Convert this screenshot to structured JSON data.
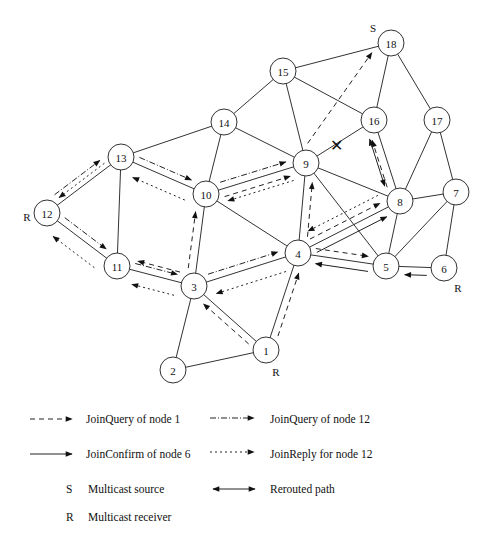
{
  "diagram": {
    "nodes": [
      {
        "id": "1",
        "x": 266,
        "y": 350,
        "role": "R",
        "role_dx": 10,
        "role_dy": 22
      },
      {
        "id": "2",
        "x": 173,
        "y": 370
      },
      {
        "id": "3",
        "x": 194,
        "y": 286
      },
      {
        "id": "4",
        "x": 298,
        "y": 253
      },
      {
        "id": "5",
        "x": 386,
        "y": 266
      },
      {
        "id": "6",
        "x": 444,
        "y": 268,
        "role": "R",
        "role_dx": 14,
        "role_dy": 20
      },
      {
        "id": "7",
        "x": 456,
        "y": 192
      },
      {
        "id": "8",
        "x": 400,
        "y": 201
      },
      {
        "id": "9",
        "x": 306,
        "y": 163
      },
      {
        "id": "10",
        "x": 206,
        "y": 194
      },
      {
        "id": "11",
        "x": 117,
        "y": 266
      },
      {
        "id": "12",
        "x": 47,
        "y": 213,
        "role": "R",
        "role_dx": -20,
        "role_dy": 4
      },
      {
        "id": "13",
        "x": 121,
        "y": 157
      },
      {
        "id": "14",
        "x": 224,
        "y": 122
      },
      {
        "id": "15",
        "x": 283,
        "y": 71
      },
      {
        "id": "16",
        "x": 374,
        "y": 120
      },
      {
        "id": "17",
        "x": 437,
        "y": 120
      },
      {
        "id": "18",
        "x": 391,
        "y": 43,
        "role": "S",
        "role_dx": -18,
        "role_dy": -15
      }
    ],
    "edges": [
      [
        "1",
        "2"
      ],
      [
        "1",
        "3"
      ],
      [
        "1",
        "4"
      ],
      [
        "2",
        "3"
      ],
      [
        "3",
        "4"
      ],
      [
        "3",
        "10"
      ],
      [
        "3",
        "11"
      ],
      [
        "4",
        "5"
      ],
      [
        "4",
        "8"
      ],
      [
        "4",
        "9"
      ],
      [
        "4",
        "10"
      ],
      [
        "5",
        "6"
      ],
      [
        "5",
        "7"
      ],
      [
        "5",
        "8"
      ],
      [
        "5",
        "9"
      ],
      [
        "6",
        "7"
      ],
      [
        "7",
        "8"
      ],
      [
        "7",
        "17"
      ],
      [
        "8",
        "9"
      ],
      [
        "8",
        "16"
      ],
      [
        "8",
        "17"
      ],
      [
        "9",
        "10"
      ],
      [
        "9",
        "14"
      ],
      [
        "9",
        "15"
      ],
      [
        "9",
        "16"
      ],
      [
        "10",
        "13"
      ],
      [
        "10",
        "14"
      ],
      [
        "11",
        "12"
      ],
      [
        "11",
        "13"
      ],
      [
        "12",
        "13"
      ],
      [
        "13",
        "14"
      ],
      [
        "14",
        "15"
      ],
      [
        "15",
        "16"
      ],
      [
        "15",
        "18"
      ],
      [
        "16",
        "18"
      ],
      [
        "17",
        "18"
      ]
    ],
    "broken_link": {
      "between": [
        "9",
        "16"
      ],
      "x": 336,
      "y": 145,
      "glyph": "✕"
    },
    "messages": [
      {
        "type": "joinquery1",
        "from": "1",
        "to": "3",
        "offset": -7
      },
      {
        "type": "joinquery1",
        "from": "1",
        "to": "4",
        "offset": 7
      },
      {
        "type": "joinquery1",
        "from": "3",
        "to": "11",
        "offset": 10
      },
      {
        "type": "joinquery1",
        "from": "3",
        "to": "10",
        "offset": -8
      },
      {
        "type": "joinquery1",
        "from": "4",
        "to": "9",
        "offset": 8
      },
      {
        "type": "joinquery1",
        "from": "4",
        "to": "5",
        "offset": -7
      },
      {
        "type": "joinquery1",
        "from": "4",
        "to": "8",
        "offset": -7
      },
      {
        "type": "joinquery1",
        "from": "10",
        "to": "9",
        "offset": 8
      },
      {
        "type": "joinquery1",
        "from": "9",
        "to": "18",
        "offset": -10,
        "via_broken": true
      },
      {
        "type": "joinquery1",
        "from": "8",
        "to": "16",
        "offset": -8
      },
      {
        "type": "joinconfirm6",
        "from": "6",
        "to": "5",
        "offset": -8
      },
      {
        "type": "joinconfirm6",
        "from": "5",
        "to": "4",
        "offset": -8
      },
      {
        "type": "joinconfirm6",
        "from": "4",
        "to": "8",
        "offset": 8
      },
      {
        "type": "joinquery12",
        "from": "12",
        "to": "13",
        "offset": -10
      },
      {
        "type": "joinquery12",
        "from": "13",
        "to": "10",
        "offset": -7
      },
      {
        "type": "joinquery12",
        "from": "12",
        "to": "11",
        "offset": -7
      },
      {
        "type": "joinquery12",
        "from": "11",
        "to": "3",
        "offset": -7
      },
      {
        "type": "joinquery12",
        "from": "3",
        "to": "4",
        "offset": -7
      },
      {
        "type": "joinquery12",
        "from": "10",
        "to": "9",
        "offset": -7
      },
      {
        "type": "joinreply12",
        "from": "9",
        "to": "10",
        "offset": -13
      },
      {
        "type": "joinreply12",
        "from": "10",
        "to": "13",
        "offset": -14
      },
      {
        "type": "joinreply12",
        "from": "13",
        "to": "12",
        "offset": 5
      },
      {
        "type": "joinreply12",
        "from": "4",
        "to": "3",
        "offset": -14
      },
      {
        "type": "joinreply12",
        "from": "3",
        "to": "11",
        "offset": -14
      },
      {
        "type": "joinreply12",
        "from": "11",
        "to": "12",
        "offset": -15
      },
      {
        "type": "joinreply12",
        "from": "8",
        "to": "4",
        "offset": 15
      },
      {
        "type": "rerouted",
        "from": "16",
        "to": "8",
        "offset": 10
      }
    ]
  },
  "legend": {
    "items": [
      {
        "key": "joinquery1",
        "label": "JoinQuery of node 1"
      },
      {
        "key": "joinquery12",
        "label": "JoinQuery of node 12"
      },
      {
        "key": "joinconfirm6",
        "label": "JoinConfirm of node 6"
      },
      {
        "key": "joinreply12",
        "label": "JoinReply for node 12"
      },
      {
        "key": "S",
        "symbol": "S",
        "label": "Multicast source"
      },
      {
        "key": "rerouted",
        "label": "Rerouted path"
      },
      {
        "key": "R",
        "symbol": "R",
        "label": "Multicast receiver"
      }
    ]
  }
}
